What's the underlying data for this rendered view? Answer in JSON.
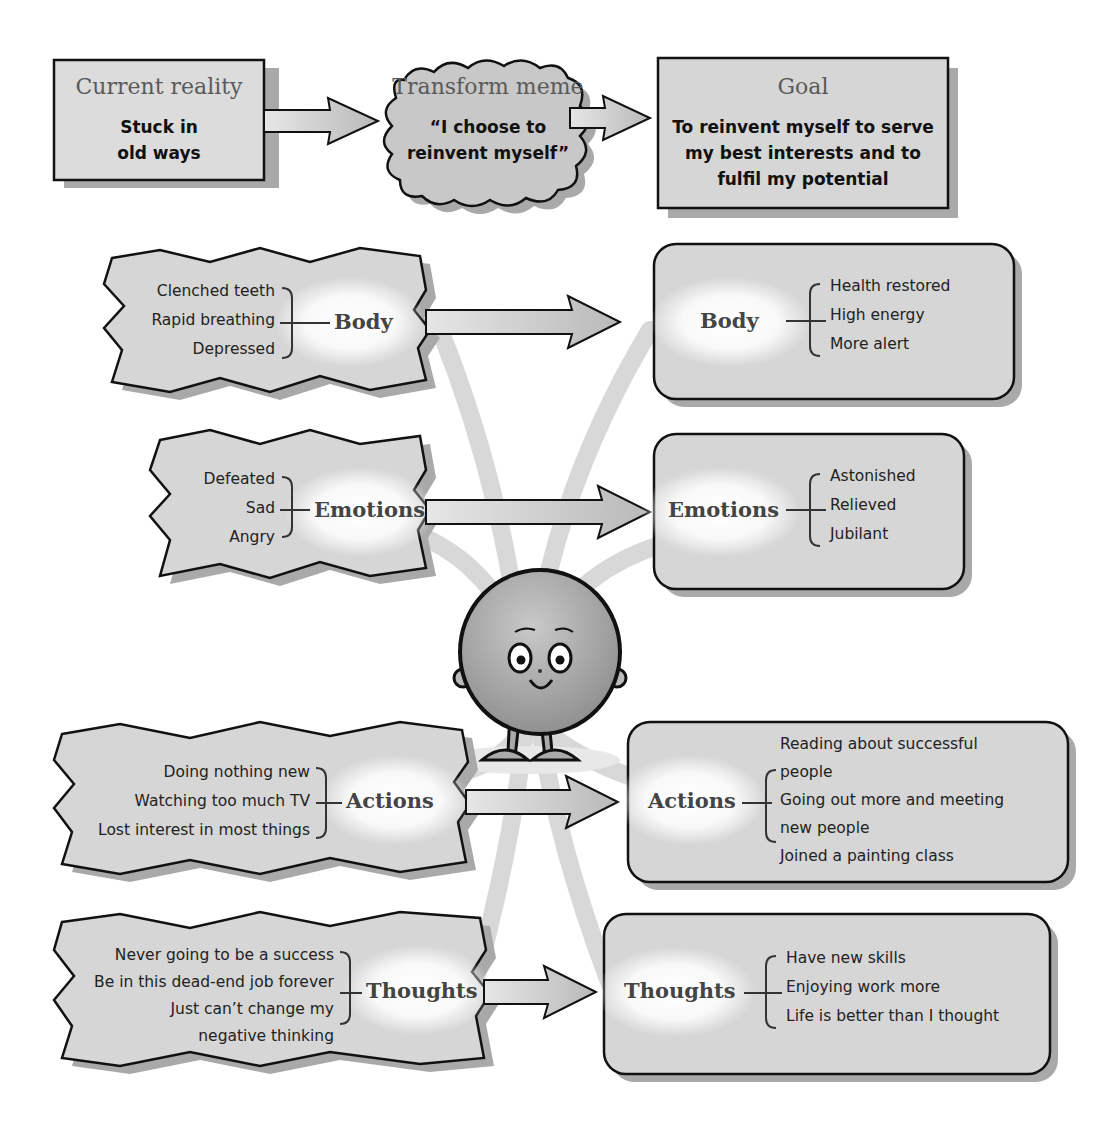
{
  "diagram": {
    "title_fragment": "",
    "flow": {
      "current_reality": {
        "title": "Current reality",
        "line1": "Stuck in",
        "line2": "old ways"
      },
      "transform_meme": {
        "title": "Transform meme",
        "line1": "“I choose to",
        "line2": "reinvent myself”"
      },
      "goal": {
        "title": "Goal",
        "line1": "To reinvent myself to serve",
        "line2": "my best interests and to",
        "line3": "fulfil my potential"
      }
    },
    "rows": [
      {
        "category": "Body",
        "before": [
          "Clenched teeth",
          "Rapid breathing",
          "Depressed"
        ],
        "after": [
          "Health restored",
          "High energy",
          "More alert"
        ]
      },
      {
        "category": "Emotions",
        "before": [
          "Defeated",
          "Sad",
          "Angry"
        ],
        "after": [
          "Astonished",
          "Relieved",
          "Jubilant"
        ]
      },
      {
        "category": "Actions",
        "before": [
          "Doing nothing new",
          "Watching too much TV",
          "Lost interest in most things"
        ],
        "after": [
          "Reading about successful",
          "people",
          "Going out more and meeting",
          "new people",
          "Joined a painting class"
        ]
      },
      {
        "category": "Thoughts",
        "before": [
          "Never going to be a success",
          "Be in this dead-end job forever",
          "Just can’t change my",
          "negative thinking"
        ],
        "after": [
          "Have new skills",
          "Enjoying work more",
          "Life is better than I thought"
        ]
      }
    ],
    "character": {
      "name": "smiling-round-character"
    },
    "colors": {
      "box_fill": "#d6d6d6",
      "outline": "#111111",
      "arrow_fill": "#cfcfcf",
      "beam": "#d9d9d9",
      "shadow": "#a8a8a8"
    }
  }
}
